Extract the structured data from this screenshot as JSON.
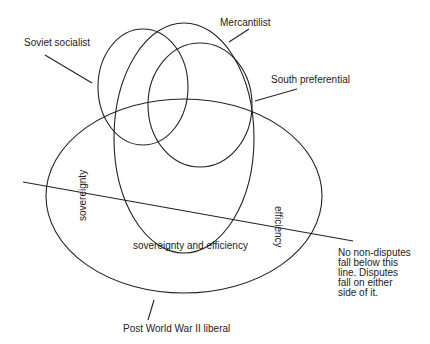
{
  "diagram": {
    "stroke_color": "#222222",
    "background": "#ffffff",
    "regimes": [
      {
        "id": "soviet-socialist",
        "label": "Soviet socialist",
        "cx": 143,
        "cy": 87,
        "rx": 45,
        "ry": 58
      },
      {
        "id": "mercantilist",
        "label": "Mercantilist",
        "cx": 184,
        "cy": 138,
        "rx": 70,
        "ry": 115
      },
      {
        "id": "south-preferential",
        "label": "South preferential",
        "cx": 200,
        "cy": 105,
        "rx": 52,
        "ry": 62
      },
      {
        "id": "post-wwii-liberal",
        "label": "Post World War II liberal",
        "cx": 184,
        "cy": 196,
        "rx": 138,
        "ry": 97
      }
    ],
    "dispute_line": {
      "x1": 23,
      "y1": 182,
      "x2": 353,
      "y2": 241
    },
    "region_labels": {
      "sovereignty": "sovereignty",
      "efficiency": "efficiency",
      "both": "sovereignty and efficiency"
    },
    "note": {
      "lines": [
        "No non-disputes",
        "fall below this",
        "line.  Disputes",
        "fall on either",
        "side of it."
      ]
    }
  }
}
